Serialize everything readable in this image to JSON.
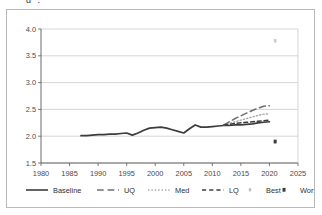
{
  "figure": {
    "background_color": "#ffffff",
    "frame_color": "#b9b9b9",
    "top_artifact_text": "g ."
  },
  "chart_data": {
    "type": "line",
    "title": "",
    "subtitle": "",
    "xlabel": "",
    "ylabel": "",
    "xlim": [
      1980,
      2025
    ],
    "ylim": [
      1.5,
      4.0
    ],
    "xticks": [
      1980,
      1985,
      1990,
      1995,
      2000,
      2005,
      2010,
      2015,
      2020,
      2025
    ],
    "yticks": [
      1.5,
      2.0,
      2.5,
      3.0,
      3.5,
      4.0
    ],
    "xtick_labels": [
      "1980",
      "1985",
      "1990",
      "1995",
      "2000",
      "2005",
      "2010",
      "2015",
      "2020",
      "2025"
    ],
    "ytick_labels": [
      "1.5",
      "2.0",
      "2.5",
      "3.0",
      "3.5",
      "4.0"
    ],
    "grid": "horizontal",
    "legend_position": "bottom",
    "series": [
      {
        "name": "Baseline",
        "style": "solid",
        "color": "#3c3c3c",
        "width": 1.7,
        "x": [
          1987,
          1988,
          1989,
          1990,
          1991,
          1992,
          1993,
          1994,
          1995,
          1996,
          1997,
          1998,
          1999,
          2000,
          2001,
          2002,
          2003,
          2004,
          2005,
          2006,
          2007,
          2008,
          2009,
          2010,
          2011,
          2012,
          2013,
          2014,
          2015,
          2016,
          2017,
          2018,
          2019,
          2020
        ],
        "values": [
          2.01,
          2.01,
          2.02,
          2.03,
          2.03,
          2.04,
          2.04,
          2.05,
          2.06,
          2.02,
          2.06,
          2.11,
          2.15,
          2.16,
          2.17,
          2.15,
          2.12,
          2.09,
          2.06,
          2.14,
          2.21,
          2.17,
          2.17,
          2.18,
          2.19,
          2.2,
          2.2,
          2.21,
          2.21,
          2.22,
          2.23,
          2.25,
          2.26,
          2.27
        ]
      },
      {
        "name": "UQ",
        "style": "long-dash",
        "color": "#6f6f6f",
        "width": 1.5,
        "x": [
          2012,
          2013,
          2014,
          2015,
          2016,
          2017,
          2018,
          2019,
          2020
        ],
        "values": [
          2.21,
          2.27,
          2.33,
          2.38,
          2.43,
          2.48,
          2.52,
          2.56,
          2.57
        ]
      },
      {
        "name": "Med",
        "style": "dotted",
        "color": "#a8a8a8",
        "width": 1.3,
        "x": [
          2012,
          2013,
          2014,
          2015,
          2016,
          2017,
          2018,
          2019,
          2020
        ],
        "values": [
          2.21,
          2.24,
          2.27,
          2.3,
          2.33,
          2.36,
          2.39,
          2.41,
          2.42
        ]
      },
      {
        "name": "LQ",
        "style": "dash",
        "color": "#3c3c3c",
        "width": 1.5,
        "x": [
          2012,
          2013,
          2014,
          2015,
          2016,
          2017,
          2018,
          2019,
          2020
        ],
        "values": [
          2.21,
          2.22,
          2.24,
          2.25,
          2.26,
          2.27,
          2.28,
          2.29,
          2.3
        ]
      }
    ],
    "markers": [
      {
        "name": "Best",
        "style": "point",
        "color": "#cacaca",
        "x": [
          2021
        ],
        "values": [
          3.78
        ]
      },
      {
        "name": "Worst",
        "style": "square",
        "color": "#3c3c3c",
        "x": [
          2021
        ],
        "values": [
          1.9
        ]
      }
    ],
    "legend": [
      {
        "label": "Baseline",
        "style": "solid",
        "color": "#3c3c3c"
      },
      {
        "label": "UQ",
        "style": "long-dash",
        "color": "#6f6f6f"
      },
      {
        "label": "Med",
        "style": "dotted",
        "color": "#a8a8a8"
      },
      {
        "label": "LQ",
        "style": "dash",
        "color": "#3c3c3c"
      },
      {
        "label": "Best",
        "style": "point",
        "color": "#bdbdbd"
      },
      {
        "label": "Worst",
        "style": "square",
        "color": "#3c3c3c"
      }
    ]
  }
}
